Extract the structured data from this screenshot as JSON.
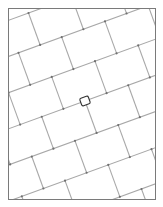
{
  "document": {
    "title": "Tilted tile grid diagram",
    "canvas": {
      "width": 163,
      "height": 207,
      "background": "#ffffff"
    }
  },
  "frame": {
    "name": "plot-border",
    "x": 8.5,
    "y": 8.5,
    "width": 147,
    "height": 191,
    "stroke": "#7a7a7a",
    "stroke_width": 1,
    "fill": "#ffffff"
  },
  "pattern": {
    "type": "rotated-rectangular-grid",
    "rotation_deg": -20,
    "origin": {
      "x": 85,
      "y": 101
    },
    "family_a": {
      "label": "long-tile-edges",
      "direction_deg": -20,
      "spacing": 34,
      "count": 9,
      "offsets": [
        -136,
        -102,
        -68,
        -34,
        0,
        34,
        68,
        102,
        136
      ],
      "stroke": "#a8a8a8",
      "stroke_width": 1.1
    },
    "family_b": {
      "label": "short-tile-edges",
      "direction_deg": 70,
      "spacing": 46,
      "count": 9,
      "offsets": [
        -184,
        -138,
        -92,
        -46,
        0,
        46,
        92,
        138,
        184
      ],
      "stroke": "#a8a8a8",
      "stroke_width": 1.1,
      "stagger": 23
    },
    "joint_dots": {
      "radius": 1.1,
      "fill": "#6f6f6f"
    }
  },
  "marker": {
    "name": "selected-tile-marker",
    "shape": "rounded-square",
    "center_x": 85,
    "center_y": 101,
    "width": 9,
    "height": 8,
    "rotation_deg": -20,
    "corner_radius": 1.6,
    "stroke": "#333333",
    "stroke_width": 1.1,
    "fill": "#ffffff"
  },
  "colors": {
    "background": "#ffffff",
    "border": "#7a7a7a",
    "grid_line": "#a8a8a8",
    "marker_outline": "#333333",
    "joint": "#6f6f6f"
  }
}
